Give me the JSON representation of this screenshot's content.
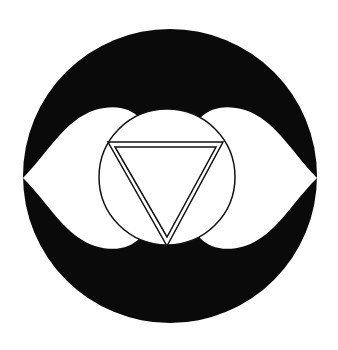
{
  "symbol": {
    "name": "ajna-chakra-symbol",
    "colors": {
      "background": "#ffffff",
      "disc": "#0a0a0a",
      "petals": "#ffffff",
      "stroke": "#111111"
    }
  }
}
